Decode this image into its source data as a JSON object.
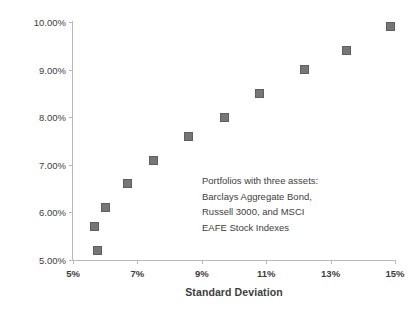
{
  "chart_data": {
    "type": "scatter",
    "title": "",
    "xlabel": "Standard Deviation",
    "ylabel": "Return per Annum",
    "xlim": [
      5,
      15
    ],
    "ylim": [
      5,
      10
    ],
    "grid": false,
    "legend": "none",
    "x_tick_labels": [
      "5%",
      "7%",
      "9%",
      "11%",
      "13%",
      "15%"
    ],
    "x_ticks": [
      5,
      7,
      9,
      11,
      13,
      15
    ],
    "y_tick_labels": [
      "5.00%",
      "6.00%",
      "7.00%",
      "8.00%",
      "9.00%",
      "10.00%"
    ],
    "y_ticks": [
      5,
      6,
      7,
      8,
      9,
      10
    ],
    "marker_color": "#767676",
    "marker_edge_color": "#5f5f5f",
    "axis_color": "#b9b9b9",
    "text_color": "#3d3d3d",
    "series": [
      {
        "name": "Portfolios with three assets",
        "points": [
          {
            "x": 5.75,
            "y": 5.2
          },
          {
            "x": 5.68,
            "y": 5.7
          },
          {
            "x": 6.0,
            "y": 6.1
          },
          {
            "x": 6.7,
            "y": 6.6
          },
          {
            "x": 7.5,
            "y": 7.1
          },
          {
            "x": 8.6,
            "y": 7.6
          },
          {
            "x": 9.7,
            "y": 8.0
          },
          {
            "x": 10.8,
            "y": 8.5
          },
          {
            "x": 12.2,
            "y": 9.0
          },
          {
            "x": 13.5,
            "y": 9.4
          },
          {
            "x": 14.85,
            "y": 9.9
          }
        ]
      }
    ],
    "annotations": [
      {
        "lines": [
          "Portfolios with three assets:",
          "Barclays Aggregate Bond,",
          "Russell 3000, and MSCI",
          "EAFE Stock Indexes"
        ]
      }
    ]
  }
}
